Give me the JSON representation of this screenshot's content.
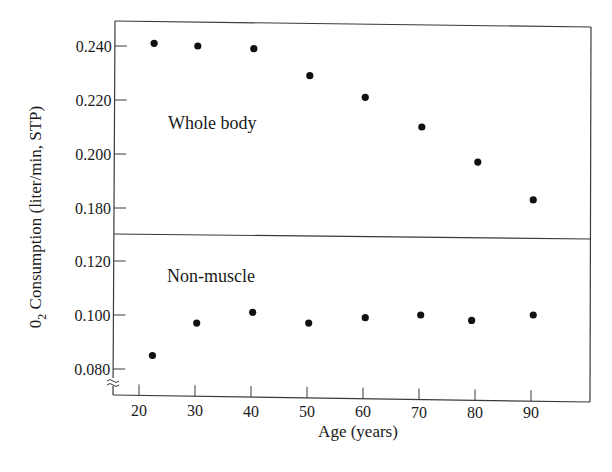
{
  "chart_data": {
    "type": "scatter",
    "title": "",
    "xlabel": "Age (years)",
    "ylabel": "0₂ Consumption (liter/min, STP)",
    "ylabel_parts": {
      "prefix": "0",
      "subscript": "2",
      "rest": " Consumption (liter/min, STP)"
    },
    "x_ticks": [
      20,
      30,
      40,
      50,
      60,
      70,
      80,
      90
    ],
    "xlim": [
      15,
      100
    ],
    "grid": false,
    "legend": null,
    "panels": [
      {
        "name": "Whole body",
        "label": "Whole body",
        "y_ticks": [
          "0.240",
          "0.220",
          "0.200",
          "0.180"
        ],
        "y_tick_values": [
          0.24,
          0.22,
          0.2,
          0.18
        ],
        "ylim": [
          0.17,
          0.249
        ],
        "x": [
          22.7,
          30.5,
          40.5,
          50.5,
          60.4,
          70.5,
          80.5,
          90.4
        ],
        "y": [
          0.241,
          0.24,
          0.239,
          0.229,
          0.221,
          0.21,
          0.197,
          0.183
        ]
      },
      {
        "name": "Non-muscle",
        "label": "Non-muscle",
        "y_ticks": [
          "0.120",
          "0.100",
          "0.080"
        ],
        "y_tick_values": [
          0.12,
          0.1,
          0.08
        ],
        "ylim": [
          0.07,
          0.13
        ],
        "axis_break": true,
        "x": [
          22.4,
          30.3,
          40.3,
          50.3,
          60.4,
          70.3,
          79.4,
          90.4
        ],
        "y": [
          0.085,
          0.097,
          0.101,
          0.097,
          0.099,
          0.1,
          0.098,
          0.1
        ]
      }
    ]
  },
  "labels": {
    "x_axis": "Age (years)",
    "y_axis_prefix": "0",
    "y_axis_sub": "2",
    "y_axis_rest": " Consumption (liter/min, STP)",
    "panel_top": "Whole body",
    "panel_bottom": "Non-muscle",
    "x_ticks": [
      "20",
      "30",
      "40",
      "50",
      "60",
      "70",
      "80",
      "90"
    ],
    "y_ticks_top": [
      "0.240",
      "0.220",
      "0.200",
      "0.180"
    ],
    "y_ticks_bottom": [
      "0.120",
      "0.100",
      "0.080"
    ]
  },
  "colors": {
    "background": "#ffffff",
    "ink": "#111111",
    "frame": "#3a3a3a"
  }
}
